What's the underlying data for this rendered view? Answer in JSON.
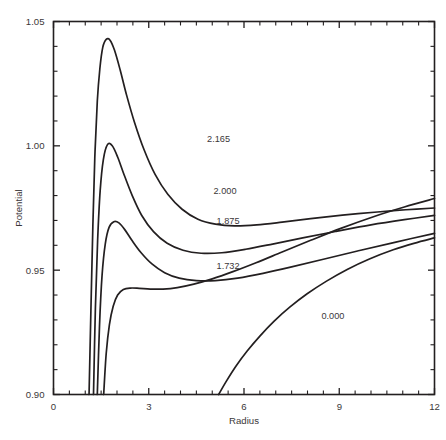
{
  "chart_data": {
    "type": "line",
    "title": "",
    "subtitle": "",
    "xlabel": "Radius",
    "ylabel": "Potential",
    "xlim": [
      0,
      12
    ],
    "ylim": [
      0.9,
      1.05
    ],
    "xticks": [
      0,
      3,
      6,
      9,
      12
    ],
    "xticklabels": [
      "0",
      "3",
      "6",
      "9",
      "12"
    ],
    "yticks": [
      0.9,
      0.95,
      1.0,
      1.05
    ],
    "yticklabels": [
      "0.90",
      "0.95",
      "1.00",
      "1.05"
    ],
    "x_minor_tick_step": 0.5,
    "y_minor_tick_step": 0.01,
    "grid": false,
    "legend": "inline-curve-labels",
    "series": [
      {
        "name": "2.165",
        "label": "2.165",
        "label_x": 5.2,
        "label_y": 1.0015,
        "points": [
          [
            1.12,
            0.9
          ],
          [
            1.18,
            0.935
          ],
          [
            1.24,
            0.968
          ],
          [
            1.3,
            0.995
          ],
          [
            1.38,
            1.018
          ],
          [
            1.46,
            1.031
          ],
          [
            1.55,
            1.0395
          ],
          [
            1.66,
            1.0428
          ],
          [
            1.78,
            1.0425
          ],
          [
            1.92,
            1.0385
          ],
          [
            2.1,
            1.0305
          ],
          [
            2.3,
            1.0205
          ],
          [
            2.55,
            1.0095
          ],
          [
            2.85,
            0.9985
          ],
          [
            3.2,
            0.9885
          ],
          [
            3.6,
            0.9805
          ],
          [
            4.05,
            0.9745
          ],
          [
            4.55,
            0.9705
          ],
          [
            5.1,
            0.9685
          ],
          [
            5.7,
            0.9678
          ],
          [
            6.4,
            0.9682
          ],
          [
            7.2,
            0.9693
          ],
          [
            8.1,
            0.9707
          ],
          [
            9.1,
            0.9721
          ],
          [
            10.2,
            0.9734
          ],
          [
            11.1,
            0.9743
          ],
          [
            12.0,
            0.975
          ]
        ]
      },
      {
        "name": "2.000",
        "label": "2.000",
        "label_x": 5.4,
        "label_y": 0.9805,
        "points": [
          [
            1.26,
            0.9
          ],
          [
            1.32,
            0.935
          ],
          [
            1.39,
            0.962
          ],
          [
            1.47,
            0.982
          ],
          [
            1.57,
            0.9945
          ],
          [
            1.7,
            1.0005
          ],
          [
            1.85,
            1.0
          ],
          [
            2.02,
            0.9955
          ],
          [
            2.22,
            0.9885
          ],
          [
            2.48,
            0.98
          ],
          [
            2.78,
            0.972
          ],
          [
            3.15,
            0.9655
          ],
          [
            3.58,
            0.9608
          ],
          [
            4.08,
            0.958
          ],
          [
            4.65,
            0.9568
          ],
          [
            5.3,
            0.957
          ],
          [
            6.05,
            0.9584
          ],
          [
            6.9,
            0.9605
          ],
          [
            7.85,
            0.963
          ],
          [
            8.9,
            0.9656
          ],
          [
            10.0,
            0.9682
          ],
          [
            11.05,
            0.9703
          ],
          [
            12.0,
            0.972
          ]
        ]
      },
      {
        "name": "1.875",
        "label": "1.875",
        "label_x": 5.5,
        "label_y": 0.9685,
        "points": [
          [
            1.38,
            0.9
          ],
          [
            1.45,
            0.928
          ],
          [
            1.53,
            0.948
          ],
          [
            1.63,
            0.9605
          ],
          [
            1.75,
            0.9672
          ],
          [
            1.9,
            0.9695
          ],
          [
            2.06,
            0.969
          ],
          [
            2.25,
            0.9662
          ],
          [
            2.48,
            0.9618
          ],
          [
            2.76,
            0.957
          ],
          [
            3.1,
            0.9525
          ],
          [
            3.5,
            0.949
          ],
          [
            3.96,
            0.9468
          ],
          [
            4.5,
            0.9458
          ],
          [
            5.1,
            0.9458
          ],
          [
            5.8,
            0.9468
          ],
          [
            6.6,
            0.9487
          ],
          [
            7.5,
            0.9513
          ],
          [
            8.5,
            0.9544
          ],
          [
            9.6,
            0.9578
          ],
          [
            10.75,
            0.9612
          ],
          [
            12.0,
            0.9648
          ]
        ]
      },
      {
        "name": "1.732",
        "label": "1.732",
        "label_x": 5.5,
        "label_y": 0.9505,
        "points": [
          [
            1.58,
            0.9
          ],
          [
            1.66,
            0.9165
          ],
          [
            1.76,
            0.928
          ],
          [
            1.88,
            0.9355
          ],
          [
            2.02,
            0.94
          ],
          [
            2.2,
            0.9422
          ],
          [
            2.42,
            0.9428
          ],
          [
            2.7,
            0.9427
          ],
          [
            3.05,
            0.9424
          ],
          [
            3.45,
            0.9424
          ],
          [
            3.9,
            0.943
          ],
          [
            4.42,
            0.9444
          ],
          [
            5.0,
            0.9465
          ],
          [
            5.65,
            0.9494
          ],
          [
            6.38,
            0.953
          ],
          [
            7.2,
            0.9573
          ],
          [
            8.1,
            0.962
          ],
          [
            9.05,
            0.9668
          ],
          [
            10.1,
            0.9716
          ],
          [
            11.05,
            0.9754
          ],
          [
            12.0,
            0.9788
          ]
        ]
      },
      {
        "name": "0.000",
        "label": "0.000",
        "label_x": 8.8,
        "label_y": 0.9305,
        "points": [
          [
            5.2,
            0.9
          ],
          [
            5.45,
            0.9055
          ],
          [
            5.75,
            0.9115
          ],
          [
            6.1,
            0.9175
          ],
          [
            6.5,
            0.9235
          ],
          [
            6.95,
            0.9295
          ],
          [
            7.45,
            0.9352
          ],
          [
            8.0,
            0.9406
          ],
          [
            8.6,
            0.9456
          ],
          [
            9.25,
            0.9503
          ],
          [
            9.95,
            0.9545
          ],
          [
            10.7,
            0.9582
          ],
          [
            11.35,
            0.9608
          ],
          [
            12.0,
            0.963
          ]
        ]
      }
    ]
  },
  "axes": {
    "x_title": "Radius",
    "y_title": "Potential"
  },
  "colors": {
    "ink": "#231f20",
    "text": "#3b3739",
    "background": "#ffffff"
  }
}
